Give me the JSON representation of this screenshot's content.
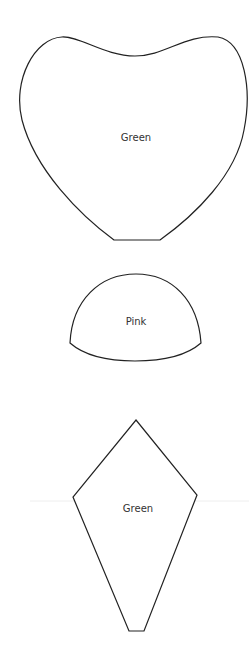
{
  "pattern": {
    "pieces": [
      {
        "id": "heart-petal",
        "label": "Green"
      },
      {
        "id": "dome",
        "label": "Pink"
      },
      {
        "id": "kite-leaf",
        "label": "Green"
      }
    ]
  },
  "colors": {
    "background": "#ffffff",
    "outline": "#222222",
    "text": "#333333",
    "guide_line": "#eeeeee"
  }
}
